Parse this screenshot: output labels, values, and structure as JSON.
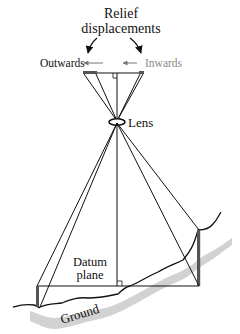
{
  "diagram": {
    "title_line1": "Relief",
    "title_line2": "displacements",
    "outwards_label": "Outwards",
    "inwards_label": "Inwards",
    "lens_label": "Lens",
    "datum_label_line1": "Datum",
    "datum_label_line2": "plane",
    "ground_label": "Ground",
    "colors": {
      "line": "#111111",
      "inwards_text": "#8a8a8a",
      "arrow_gray": "#777777",
      "pole": "#555555",
      "ground_shadow": "#cfcfcf"
    }
  }
}
